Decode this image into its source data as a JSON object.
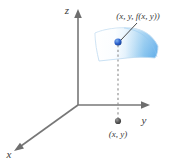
{
  "figure": {
    "background_color": "#ffffff",
    "axes": {
      "x": {
        "label": "x",
        "label_x": 9,
        "label_y": 158
      },
      "y": {
        "label": "y",
        "label_x": 144,
        "label_y": 124
      },
      "z": {
        "label": "z",
        "label_x": 67,
        "label_y": 14
      }
    },
    "labels": {
      "surface_point": "(x, y, f(x, y))",
      "domain_point": "(x, y)"
    },
    "points": {
      "surface_point": {
        "x": 118,
        "y": 42,
        "color": "#2b5fcf"
      },
      "domain_point": {
        "x": 118,
        "y": 121,
        "color": "#555555"
      }
    },
    "colors": {
      "axis": "#777777",
      "surface_blue": "#5aa9e8",
      "surface_pale": "#fbfdff",
      "surface_edge": "#bcd9f0",
      "dashed_line": "#8a8a8a",
      "leader_line": "#4a4a4a",
      "text": "#3a3a3a"
    },
    "origin": {
      "x": 78,
      "y": 105
    }
  }
}
